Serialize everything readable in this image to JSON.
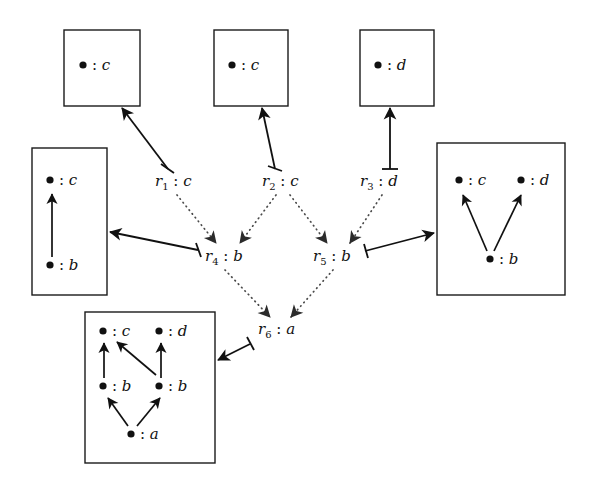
{
  "figure": {
    "type": "diagram",
    "background_color": "#ffffff",
    "stroke_color": "#111111",
    "dotted_edge_color": "#4a4a4a"
  },
  "graph_objects": [
    {
      "id": "box-top-left",
      "shape": "rectangle",
      "x": 64,
      "y": 30,
      "width": 76,
      "height": 76,
      "vertices": [
        {
          "id": "tl-c",
          "dot": "●",
          "colon": ":",
          "type": "c",
          "cx": 88,
          "cy": 68
        }
      ],
      "internal_arrows": []
    },
    {
      "id": "box-top-middle",
      "shape": "rectangle",
      "x": 214,
      "y": 30,
      "width": 74,
      "height": 76,
      "vertices": [
        {
          "id": "tm-c",
          "dot": "●",
          "colon": ":",
          "type": "c",
          "cx": 237,
          "cy": 68
        }
      ],
      "internal_arrows": []
    },
    {
      "id": "box-top-right",
      "shape": "rectangle",
      "x": 360,
      "y": 30,
      "width": 74,
      "height": 76,
      "vertices": [
        {
          "id": "tr-d",
          "dot": "●",
          "colon": ":",
          "type": "d",
          "cx": 383,
          "cy": 68
        }
      ],
      "internal_arrows": []
    },
    {
      "id": "box-left",
      "shape": "rectangle",
      "x": 32,
      "y": 148,
      "width": 75,
      "height": 147,
      "vertices": [
        {
          "id": "l-c",
          "dot": "●",
          "colon": ":",
          "type": "c",
          "cx": 54,
          "cy": 183
        },
        {
          "id": "l-b",
          "dot": "●",
          "colon": ":",
          "type": "b",
          "cx": 54,
          "cy": 268
        }
      ],
      "internal_arrows": [
        {
          "from": "l-b",
          "to": "l-c"
        }
      ]
    },
    {
      "id": "box-right",
      "shape": "rectangle",
      "x": 437,
      "y": 143,
      "width": 128,
      "height": 152,
      "vertices": [
        {
          "id": "r-c",
          "dot": "●",
          "colon": ":",
          "type": "c",
          "cx": 464,
          "cy": 183
        },
        {
          "id": "r-d",
          "dot": "●",
          "colon": ":",
          "type": "d",
          "cx": 527,
          "cy": 183
        },
        {
          "id": "r-b",
          "dot": "●",
          "colon": ":",
          "type": "b",
          "cx": 495,
          "cy": 262
        }
      ],
      "internal_arrows": [
        {
          "from": "r-b",
          "to": "r-c"
        },
        {
          "from": "r-b",
          "to": "r-d"
        }
      ]
    },
    {
      "id": "box-bottom",
      "shape": "rectangle",
      "x": 85,
      "y": 312,
      "width": 130,
      "height": 151,
      "vertices": [
        {
          "id": "bt-c",
          "dot": "●",
          "colon": ":",
          "type": "c",
          "cx": 108,
          "cy": 333
        },
        {
          "id": "bt-d",
          "dot": "●",
          "colon": ":",
          "type": "d",
          "cx": 164,
          "cy": 333
        },
        {
          "id": "bt-b1",
          "dot": "●",
          "colon": ":",
          "type": "b",
          "cx": 108,
          "cy": 388
        },
        {
          "id": "bt-b2",
          "dot": "●",
          "colon": ":",
          "type": "b",
          "cx": 164,
          "cy": 388
        },
        {
          "id": "bt-a",
          "dot": "●",
          "colon": ":",
          "type": "a",
          "cx": 136,
          "cy": 436
        }
      ],
      "internal_arrows": [
        {
          "from": "bt-b1",
          "to": "bt-c"
        },
        {
          "from": "bt-b2",
          "to": "bt-c"
        },
        {
          "from": "bt-b2",
          "to": "bt-d"
        },
        {
          "from": "bt-a",
          "to": "bt-b1"
        },
        {
          "from": "bt-a",
          "to": "bt-b2"
        }
      ]
    }
  ],
  "rules": [
    {
      "id": "r1",
      "name": "r",
      "index": "1",
      "colon": ":",
      "type": "c",
      "x": 155,
      "y": 186
    },
    {
      "id": "r2",
      "name": "r",
      "index": "2",
      "colon": ":",
      "type": "c",
      "x": 262,
      "y": 186
    },
    {
      "id": "r3",
      "name": "r",
      "index": "3",
      "colon": ":",
      "type": "d",
      "x": 360,
      "y": 186
    },
    {
      "id": "r4",
      "name": "r",
      "index": "4",
      "colon": ":",
      "type": "b",
      "x": 205,
      "y": 261
    },
    {
      "id": "r5",
      "name": "r",
      "index": "5",
      "colon": ":",
      "type": "b",
      "x": 313,
      "y": 261
    },
    {
      "id": "r6",
      "name": "r",
      "index": "6",
      "colon": ":",
      "type": "a",
      "x": 258,
      "y": 334
    }
  ],
  "solid_edges": [
    {
      "id": "edge-r1-to-box-top-left",
      "from": "r1",
      "to": "box-top-left",
      "style": "solid",
      "tail": "bar",
      "head": "arrow"
    },
    {
      "id": "edge-r2-to-box-top-middle",
      "from": "r2",
      "to": "box-top-middle",
      "style": "solid",
      "tail": "bar",
      "head": "arrow"
    },
    {
      "id": "edge-r3-to-box-top-right",
      "from": "r3",
      "to": "box-top-right",
      "style": "solid",
      "tail": "bar",
      "head": "arrow"
    },
    {
      "id": "edge-r4-to-box-left",
      "from": "r4",
      "to": "box-left",
      "style": "solid",
      "tail": "bar",
      "head": "arrow"
    },
    {
      "id": "edge-r5-to-box-right",
      "from": "r5",
      "to": "box-right",
      "style": "solid",
      "tail": "bar",
      "head": "arrow"
    },
    {
      "id": "edge-r6-to-box-bottom",
      "from": "r6",
      "to": "box-bottom",
      "style": "solid",
      "tail": "bar",
      "head": "arrow"
    }
  ],
  "dotted_edges": [
    {
      "id": "edge-r1-r4",
      "from": "r1",
      "to": "r4",
      "style": "dotted",
      "head": "arrow"
    },
    {
      "id": "edge-r2-r4",
      "from": "r2",
      "to": "r4",
      "style": "dotted",
      "head": "arrow"
    },
    {
      "id": "edge-r2-r5",
      "from": "r2",
      "to": "r5",
      "style": "dotted",
      "head": "arrow"
    },
    {
      "id": "edge-r3-r5",
      "from": "r3",
      "to": "r5",
      "style": "dotted",
      "head": "arrow"
    },
    {
      "id": "edge-r4-r6",
      "from": "r4",
      "to": "r6",
      "style": "dotted",
      "head": "arrow"
    },
    {
      "id": "edge-r5-r6",
      "from": "r5",
      "to": "r6",
      "style": "dotted",
      "head": "arrow"
    }
  ]
}
